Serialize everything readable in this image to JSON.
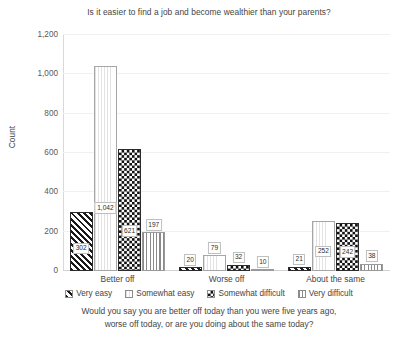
{
  "chart_data": {
    "type": "bar",
    "title": "Is it easier to find a job and become wealthier than your parents?",
    "caption_line1": "Would you say you are better off today than you were five years ago,",
    "caption_line2": "worse off today, or are you doing about the same today?",
    "xlabel": "",
    "ylabel": "Count",
    "ylim": [
      0,
      1200
    ],
    "yticks": [
      0,
      200,
      400,
      600,
      800,
      1000,
      1200
    ],
    "ytick_labels": [
      "0",
      "200",
      "400",
      "600",
      "800",
      "1,000",
      "1,200"
    ],
    "grid": true,
    "legend_position": "bottom",
    "categories": [
      "Better off",
      "Worse off",
      "About the same"
    ],
    "series": [
      {
        "name": "Very easy",
        "pattern": "diagonal-hatch",
        "values": [
          302,
          20,
          21
        ],
        "labels": [
          "302",
          "20",
          "21"
        ]
      },
      {
        "name": "Somewhat easy",
        "pattern": "light-vertical-dotted",
        "values": [
          1042,
          79,
          252
        ],
        "labels": [
          "1,042",
          "79",
          "252"
        ]
      },
      {
        "name": "Somewhat difficult",
        "pattern": "checkerboard",
        "values": [
          621,
          32,
          242
        ],
        "labels": [
          "621",
          "32",
          "242"
        ]
      },
      {
        "name": "Very difficult",
        "pattern": "vertical-stripes",
        "values": [
          197,
          10,
          38
        ],
        "labels": [
          "197",
          "10",
          "38"
        ]
      }
    ]
  }
}
